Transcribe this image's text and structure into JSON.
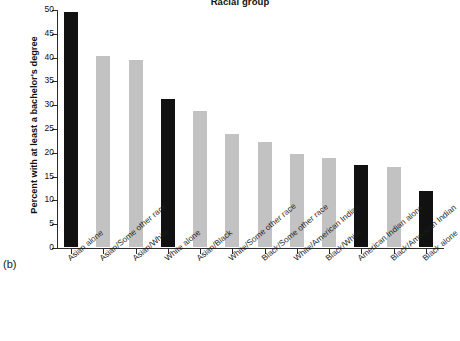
{
  "figure": {
    "panel_label": "(b)",
    "title": "Racial group",
    "ylabel": "Percent with at least a bachelor's degree"
  },
  "chart_data": {
    "type": "bar",
    "title": "Racial group",
    "xlabel": "",
    "ylabel": "Percent with at least a bachelor's degree",
    "ylim": [
      0,
      50
    ],
    "yticks": [
      0,
      5,
      10,
      15,
      20,
      25,
      30,
      35,
      40,
      45,
      50
    ],
    "ytick_labels": [
      "0",
      "5",
      "10",
      "15",
      "20",
      "25",
      "30",
      "35",
      "40",
      "45",
      "50"
    ],
    "grid": false,
    "legend": null,
    "categories": [
      "Asian alone",
      "Asian/Some other race",
      "Asian/White",
      "White alone",
      "Asian/Black",
      "White/Some other race",
      "Black/Some other race",
      "White/American Indian",
      "Black/White",
      "American Indian alone",
      "Black/American Indian",
      "Black alone"
    ],
    "values": [
      49.3,
      40.2,
      39.3,
      31.0,
      28.5,
      23.8,
      22.0,
      19.6,
      18.8,
      17.3,
      16.8,
      11.8
    ],
    "bar_colors": [
      "#111111",
      "#c2c2c2",
      "#c2c2c2",
      "#111111",
      "#c2c2c2",
      "#c2c2c2",
      "#c2c2c2",
      "#c2c2c2",
      "#c2c2c2",
      "#111111",
      "#c2c2c2",
      "#111111"
    ],
    "colors": {
      "single_race": "#111111",
      "multi_race": "#c2c2c2",
      "axis": "#2a2a2a",
      "background": "#ffffff"
    }
  }
}
